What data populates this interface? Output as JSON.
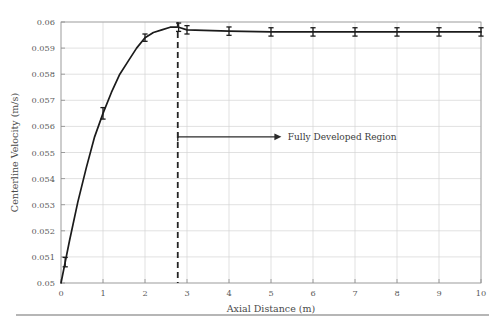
{
  "chart_data": {
    "type": "line",
    "title": "",
    "xlabel": "Axial Distance (m)",
    "ylabel": "Centerline Velocity (m/s)",
    "xlim": [
      0,
      10
    ],
    "ylim": [
      0.05,
      0.06
    ],
    "xticks": [
      "0",
      "1",
      "2",
      "3",
      "4",
      "5",
      "6",
      "7",
      "8",
      "9",
      "10"
    ],
    "yticks": [
      "0.05",
      "0.051",
      "0.052",
      "0.053",
      "0.054",
      "0.055",
      "0.056",
      "0.057",
      "0.058",
      "0.059",
      "0.06"
    ],
    "grid": true,
    "legend": "none",
    "series": [
      {
        "name": "Centerline Velocity",
        "x": [
          0.0,
          0.1,
          0.2,
          0.4,
          0.6,
          0.8,
          1.0,
          1.2,
          1.4,
          1.6,
          1.8,
          2.0,
          2.2,
          2.4,
          2.6,
          2.8,
          3.0,
          4.0,
          5.0,
          6.0,
          7.0,
          8.0,
          9.0,
          10.0
        ],
        "y": [
          0.05,
          0.0508,
          0.0516,
          0.0531,
          0.0544,
          0.0556,
          0.0565,
          0.0573,
          0.058,
          0.0585,
          0.059,
          0.0594,
          0.0596,
          0.0597,
          0.0598,
          0.0598,
          0.0597,
          0.05965,
          0.05962,
          0.05962,
          0.05962,
          0.05962,
          0.05962,
          0.05962
        ]
      }
    ],
    "error_bars": {
      "x": [
        0.1,
        1.0,
        2.0,
        2.8,
        3.0,
        4.0,
        5.0,
        6.0,
        7.0,
        8.0,
        9.0,
        10.0
      ],
      "y": [
        0.0508,
        0.0565,
        0.0594,
        0.0598,
        0.0597,
        0.05965,
        0.05962,
        0.05962,
        0.05962,
        0.05962,
        0.05962,
        0.05962
      ],
      "yerr": [
        0.00018,
        0.00022,
        0.00014,
        0.00016,
        0.00016,
        0.00016,
        0.00016,
        0.00016,
        0.00016,
        0.00016,
        0.00016,
        0.00016
      ]
    },
    "annotations": [
      {
        "text": "Fully Developed Region",
        "vline_x": 2.78,
        "arrow_y": 0.0556,
        "arrow_from_x": 2.78,
        "arrow_to_x": 5.2,
        "text_x": 5.4
      }
    ],
    "colors": {
      "curve": "#1b1b1b",
      "grid": "#d4d4d4",
      "frame": "#9a9a9a",
      "vline": "#232323",
      "text": "#4a4a4a"
    }
  }
}
